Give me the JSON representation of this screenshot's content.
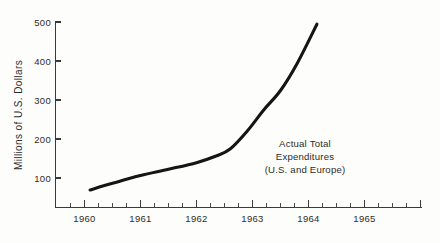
{
  "chart_data": {
    "type": "line",
    "title": "",
    "xlabel": "",
    "ylabel": "Millions of U.S. Dollars",
    "xlim": [
      1959.5,
      1965.5
    ],
    "ylim": [
      0,
      500
    ],
    "grid": false,
    "legend_position": "none",
    "x_tick_labels": [
      "1960",
      "1961",
      "1962",
      "1963",
      "1964",
      "1965"
    ],
    "x_tick_values": [
      1960,
      1961,
      1962,
      1963,
      1964,
      1965
    ],
    "x_minor_ticks_between": 3,
    "y_tick_labels": [
      "100",
      "200",
      "300",
      "400",
      "500"
    ],
    "y_tick_values": [
      100,
      200,
      300,
      400,
      500
    ],
    "series": [
      {
        "name": "Actual Total Expenditures (U.S. and Europe)",
        "color": "#151514",
        "x": [
          1960.1,
          1960.5,
          1961.0,
          1961.5,
          1962.0,
          1962.35,
          1962.6,
          1962.9,
          1963.2,
          1963.5,
          1963.8,
          1964.15
        ],
        "values": [
          45,
          62,
          82,
          98,
          115,
          132,
          150,
          195,
          250,
          300,
          370,
          470
        ]
      }
    ],
    "annotations": [
      {
        "name": "series-annotation",
        "lines": [
          "Actual Total",
          "Expenditures",
          "(U.S. and Europe)"
        ],
        "x": 1963.45,
        "y": 185
      }
    ]
  },
  "axis": {
    "y_title": "Millions of U.S. Dollars",
    "y_labels": [
      "500",
      "400",
      "300",
      "200",
      "100"
    ],
    "x_labels": [
      "1960",
      "1961",
      "1962",
      "1963",
      "1964",
      "1965"
    ]
  },
  "annotation": {
    "line1": "Actual Total",
    "line2": "Expenditures",
    "line3": "(U.S. and Europe)"
  },
  "colors": {
    "background": "#fdfdfb",
    "line": "#151514",
    "axis": "#3a3a38",
    "text": "#2c2c2a"
  }
}
